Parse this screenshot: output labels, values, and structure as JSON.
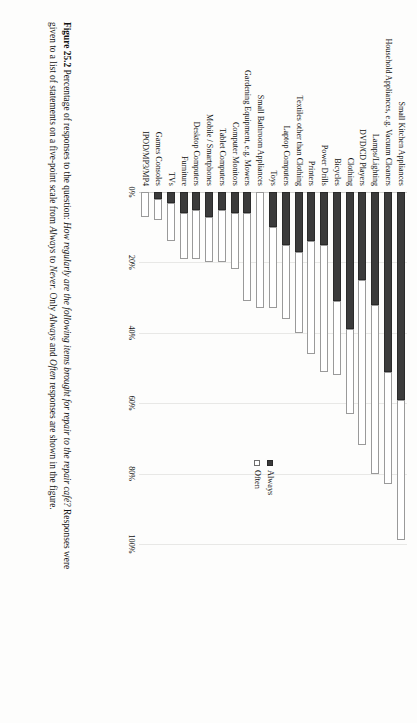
{
  "figure": {
    "number_label": "Figure 25.2",
    "caption_parts": {
      "lead": "Percentage of responses to the question: ",
      "question_italic": "How regularly are the following items brought for repair to the repair café?",
      "body": " Responses were given to a list of statements on a five-point scale from ",
      "scale_from_italic": "Always",
      "scale_mid": " to ",
      "scale_to_italic": "Never",
      "body2": ". Only ",
      "legend_always_italic": "Always",
      "body3": " and ",
      "legend_often_italic": "Often",
      "body4": " responses are shown in the figure."
    }
  },
  "legend": {
    "position": "right",
    "items": [
      {
        "label": "Always",
        "swatch": "filled-square-black",
        "color": "#3b3b3b"
      },
      {
        "label": "Often",
        "swatch": "outlined-square-white",
        "color": "#ffffff"
      }
    ]
  },
  "axis": {
    "value_ticks": [
      "0%",
      "20%",
      "40%",
      "60%",
      "80%",
      "100%"
    ],
    "value_tick_numbers": [
      0,
      20,
      40,
      60,
      80,
      100
    ]
  },
  "chart_data": {
    "type": "bar",
    "orientation": "horizontal-stacked",
    "title": "",
    "xlabel": "",
    "ylabel": "",
    "xlim": [
      0,
      100
    ],
    "grid": true,
    "legend_position": "right",
    "categories": [
      "Small Kitchen Appliances",
      "Household Appliances, e.g. Vacuum Cleaners",
      "Lamps/Lighting",
      "DVD/CD Players",
      "Clothing",
      "Bicycles",
      "Power Drills",
      "Printers",
      "Textiles other than Clothing",
      "Laptop Computers",
      "Toys",
      "Small Bathroom Appliances",
      "Gardening Equipment, e.g. Mowers",
      "Computer Monitors",
      "Tablet Computers",
      "Mobile / Smartphones",
      "Desktop Computers",
      "Furniture",
      "TVs",
      "Games Consoles",
      "IPOD/MP3/MP4"
    ],
    "series": [
      {
        "name": "Always",
        "color": "#3b3b3b",
        "values": [
          59,
          51,
          32,
          25,
          39,
          31,
          15,
          14,
          17,
          15,
          10,
          0,
          6,
          6,
          5,
          7,
          5,
          6,
          3,
          2,
          0
        ]
      },
      {
        "name": "Often",
        "color": "#ffffff",
        "values": [
          40,
          32,
          48,
          47,
          24,
          21,
          36,
          32,
          23,
          21,
          23,
          33,
          25,
          16,
          15,
          13,
          14,
          13,
          11,
          6,
          7
        ]
      }
    ],
    "totals": [
      99,
      83,
      80,
      72,
      63,
      52,
      51,
      46,
      40,
      36,
      33,
      33,
      31,
      22,
      20,
      20,
      19,
      19,
      14,
      8,
      7
    ]
  }
}
